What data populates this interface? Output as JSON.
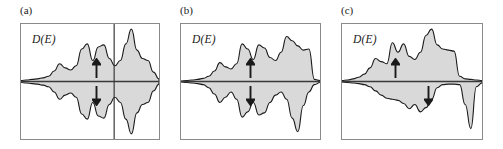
{
  "figure": {
    "caption_absent": true,
    "background": "#ffffff",
    "frame_color": "#8a8a8a",
    "fill_color": "#d9d9d9",
    "curve_color": "#1a1a1a",
    "axis_color": "#3a3a3a"
  },
  "panels": [
    {
      "id": "a",
      "label": "(a)",
      "axis_label": "D(E)",
      "x": 20,
      "y": 23,
      "width": 140,
      "height": 117,
      "label_x": 20,
      "has_fermi_line": true,
      "fermi_line_x_frac": 0.675,
      "arrow_up": {
        "x_frac": 0.545,
        "label": "spin-up-arrow"
      },
      "arrow_down": {
        "x_frac": 0.545,
        "label": "spin-down-arrow"
      },
      "arrow_up_x_frac": 0.545,
      "arrow_down_x_frac": 0.545,
      "description": "symmetric exchange-split density of states, spin-up and spin-down mirrored, Fermi level through tall right peak"
    },
    {
      "id": "b",
      "label": "(b)",
      "axis_label": "D(E)",
      "x": 180,
      "y": 23,
      "width": 141,
      "height": 117,
      "label_x": 180,
      "has_fermi_line": false,
      "fermi_line_x_frac": 0.0,
      "arrow_up_x_frac": 0.5,
      "arrow_down_x_frac": 0.5,
      "description": "exchange-split density of states with spin-down band shifted, right edge truncated at step"
    },
    {
      "id": "c",
      "label": "(c)",
      "axis_label": "D(E)",
      "x": 341,
      "y": 23,
      "width": 142,
      "height": 117,
      "label_x": 341,
      "has_fermi_line": false,
      "fermi_line_x_frac": 0.0,
      "arrow_up_x_frac": 0.385,
      "arrow_down_x_frac": 0.615,
      "description": "strongly asymmetric half-metallic density of states, spin-up majority band filled, spin-down minority band shifted right"
    }
  ],
  "chart_data": {
    "type": "area",
    "title": "",
    "xlabel": "E",
    "ylabel": "D(E)",
    "grid": false,
    "legend": "none",
    "note": "Three spin-resolved density-of-states panels. Upper half = spin-up channel, lower half = spin-down channel, mirrored about horizontal zero axis. Values are normalized shape profiles (0-1) sampled across the energy axis; no numeric tick labels appear in the figure.",
    "x": [
      0.0,
      0.04,
      0.08,
      0.12,
      0.16,
      0.2,
      0.24,
      0.28,
      0.32,
      0.36,
      0.4,
      0.44,
      0.48,
      0.52,
      0.56,
      0.6,
      0.64,
      0.68,
      0.72,
      0.76,
      0.8,
      0.84,
      0.88,
      0.92,
      0.96,
      1.0
    ],
    "series": [
      {
        "name": "panel-a-spin-up",
        "panel": "a",
        "values": [
          0.02,
          0.03,
          0.04,
          0.05,
          0.07,
          0.1,
          0.2,
          0.34,
          0.26,
          0.22,
          0.3,
          0.62,
          0.72,
          0.4,
          0.66,
          0.7,
          0.44,
          0.3,
          0.4,
          0.72,
          1.0,
          0.6,
          0.44,
          0.4,
          0.18,
          0.05
        ]
      },
      {
        "name": "panel-a-spin-down",
        "panel": "a",
        "values": [
          0.02,
          0.03,
          0.04,
          0.05,
          0.07,
          0.1,
          0.2,
          0.34,
          0.26,
          0.22,
          0.3,
          0.62,
          0.72,
          0.4,
          0.66,
          0.7,
          0.44,
          0.3,
          0.4,
          0.72,
          1.0,
          0.6,
          0.44,
          0.4,
          0.18,
          0.05
        ]
      },
      {
        "name": "panel-b-spin-up",
        "panel": "b",
        "values": [
          0.01,
          0.02,
          0.03,
          0.04,
          0.06,
          0.1,
          0.2,
          0.36,
          0.28,
          0.24,
          0.34,
          0.72,
          0.62,
          0.42,
          0.7,
          0.64,
          0.46,
          0.4,
          0.56,
          0.86,
          0.78,
          0.68,
          0.6,
          0.62,
          0.04,
          0.02
        ]
      },
      {
        "name": "panel-b-spin-down",
        "panel": "b",
        "values": [
          0.01,
          0.02,
          0.03,
          0.04,
          0.06,
          0.12,
          0.24,
          0.4,
          0.3,
          0.2,
          0.34,
          0.68,
          0.58,
          0.4,
          0.64,
          0.6,
          0.4,
          0.26,
          0.2,
          0.34,
          0.7,
          0.96,
          0.46,
          0.2,
          0.06,
          0.02
        ]
      },
      {
        "name": "panel-c-spin-up",
        "panel": "c",
        "values": [
          0.02,
          0.03,
          0.05,
          0.08,
          0.14,
          0.26,
          0.44,
          0.38,
          0.34,
          0.74,
          0.56,
          0.72,
          0.48,
          0.42,
          0.56,
          0.88,
          1.0,
          0.7,
          0.62,
          0.6,
          0.58,
          0.1,
          0.05,
          0.04,
          0.03,
          0.02
        ]
      },
      {
        "name": "panel-c-spin-down",
        "panel": "c",
        "values": [
          0.01,
          0.02,
          0.03,
          0.04,
          0.06,
          0.1,
          0.18,
          0.26,
          0.32,
          0.34,
          0.36,
          0.42,
          0.52,
          0.44,
          0.58,
          0.5,
          0.34,
          0.12,
          0.06,
          0.05,
          0.05,
          0.06,
          0.44,
          0.9,
          0.1,
          0.03
        ]
      }
    ]
  },
  "icons": {
    "arrow_up": "↑",
    "arrow_down": "↓"
  }
}
